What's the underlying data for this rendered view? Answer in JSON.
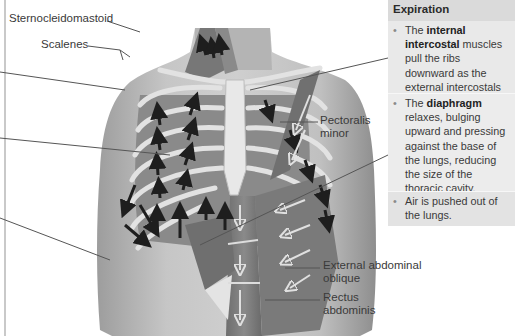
{
  "figure": {
    "labels": {
      "sternocleidomastoid": "Sternocleidomastoid",
      "scalenes": "Scalenes",
      "pectoralis_minor_1": "Pectoralis",
      "pectoralis_minor_2": "minor",
      "external_abdominal_oblique_1": "External abdominal",
      "external_abdominal_oblique_2": "oblique",
      "rectus_abdominis_1": "Rectus",
      "rectus_abdominis_2": "abdominis"
    }
  },
  "sidebar": {
    "title": "Expiration",
    "bullets": [
      {
        "pre": "The ",
        "bold": "internal intercostal",
        "post": " muscles pull the ribs downward as the external intercostals relax."
      },
      {
        "pre": "The ",
        "bold": "diaphragm",
        "post": " relaxes, bulging upward and pressing against the base of the lungs, reducing the size of the thoracic cavity."
      },
      {
        "pre": "Air is pushed out of the lungs.",
        "bold": "",
        "post": ""
      }
    ],
    "bullet_glyph": "•"
  },
  "colors": {
    "skin": "#bdbdbd",
    "skin_dark": "#9a9a9a",
    "muscle": "#7d7d7d",
    "bone": "#e6e6e6",
    "arrow": "#1e1e1e",
    "leader": "#555555",
    "sidebar_header": "#dadada"
  }
}
